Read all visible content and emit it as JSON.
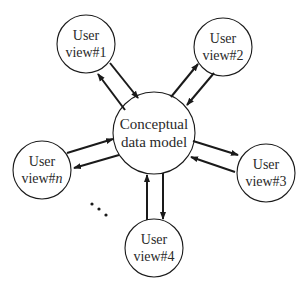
{
  "diagram": {
    "center": {
      "line1": "Conceptual",
      "line2": "data model"
    },
    "views": [
      {
        "id": "v1",
        "line1": "User",
        "line2": "view#1"
      },
      {
        "id": "v2",
        "line1": "User",
        "line2": "view#2"
      },
      {
        "id": "v3",
        "line1": "User",
        "line2": "view#3"
      },
      {
        "id": "v4",
        "line1": "User",
        "line2": "view#4"
      },
      {
        "id": "vn",
        "line1": "User",
        "line2_prefix": "view#",
        "line2_suffix": "n"
      }
    ],
    "ellipsis": "..."
  },
  "colors": {
    "stroke": "#1a1a1a",
    "text": "#2a2a2a",
    "background": "#ffffff"
  }
}
